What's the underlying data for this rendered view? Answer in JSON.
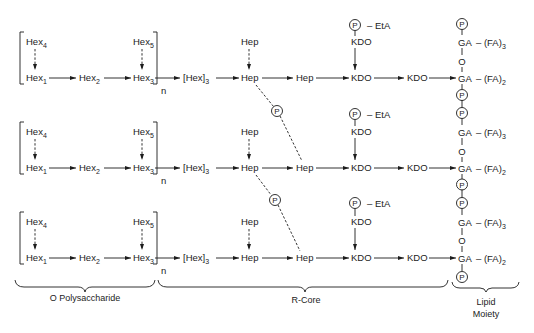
{
  "figure": {
    "rows": [
      {
        "hex4": {
          "label": "Hex",
          "sub": "4"
        },
        "hex5": {
          "label": "Hex",
          "sub": "5"
        },
        "hex1": {
          "label": "Hex",
          "sub": "1"
        },
        "hex2": {
          "label": "Hex",
          "sub": "2"
        },
        "hex3": {
          "label": "Hex",
          "sub": "3"
        },
        "repeat": "n",
        "hex_trimer": {
          "label": "[Hex]",
          "sub": "3"
        },
        "hep_branch": "Hep",
        "hep1": "Hep",
        "hep2": "Hep",
        "eta_phosphate": "P",
        "eta": "– EtA",
        "kdo_branch": "KDO",
        "kdo1": "KDO",
        "kdo2": "KDO",
        "lipid": {
          "p_top": "P",
          "ga_top": "GA",
          "fa_top": {
            "label": "– (FA)",
            "sub": "3"
          },
          "o": "O",
          "ga_bottom": "GA",
          "fa_bottom": {
            "label": "– (FA)",
            "sub": "2"
          },
          "p_bottom": "P"
        }
      },
      {
        "hex4": {
          "label": "Hex",
          "sub": "4"
        },
        "hex5": {
          "label": "Hex",
          "sub": "5"
        },
        "hex1": {
          "label": "Hex",
          "sub": "1"
        },
        "hex2": {
          "label": "Hex",
          "sub": "2"
        },
        "hex3": {
          "label": "Hex",
          "sub": "3"
        },
        "repeat": "n",
        "hex_trimer": {
          "label": "[Hex]",
          "sub": "3"
        },
        "hep_branch": "Hep",
        "hep1": "Hep",
        "hep2": "Hep",
        "eta_phosphate": "P",
        "eta": "– EtA",
        "kdo_branch": "KDO",
        "kdo1": "KDO",
        "kdo2": "KDO",
        "lipid": {
          "p_top": "P",
          "ga_top": "GA",
          "fa_top": {
            "label": "– (FA)",
            "sub": "3"
          },
          "o": "O",
          "ga_bottom": "GA",
          "fa_bottom": {
            "label": "– (FA)",
            "sub": "2"
          },
          "p_bottom": "P"
        }
      },
      {
        "hex4": {
          "label": "Hex",
          "sub": "4"
        },
        "hex5": {
          "label": "Hex",
          "sub": "5"
        },
        "hex1": {
          "label": "Hex",
          "sub": "1"
        },
        "hex2": {
          "label": "Hex",
          "sub": "2"
        },
        "hex3": {
          "label": "Hex",
          "sub": "3"
        },
        "repeat": "n",
        "hex_trimer": {
          "label": "[Hex]",
          "sub": "3"
        },
        "hep_branch": "Hep",
        "hep1": "Hep",
        "hep2": "Hep",
        "eta_phosphate": "P",
        "eta": "– EtA",
        "kdo_branch": "KDO",
        "kdo1": "KDO",
        "kdo2": "KDO",
        "lipid": {
          "p_top": "P",
          "ga_top": "GA",
          "fa_top": {
            "label": "– (FA)",
            "sub": "3"
          },
          "o": "O",
          "ga_bottom": "GA",
          "fa_bottom": {
            "label": "– (FA)",
            "sub": "2"
          },
          "p_bottom": "P"
        }
      }
    ],
    "hep_crosslinks": [
      {
        "phosphate": "P"
      },
      {
        "phosphate": "P"
      }
    ]
  },
  "braces": {
    "o_polysaccharide": "O Polysaccharide",
    "r_core": "R-Core",
    "lipid_moiety": [
      "Lipid",
      "Moiety"
    ]
  }
}
